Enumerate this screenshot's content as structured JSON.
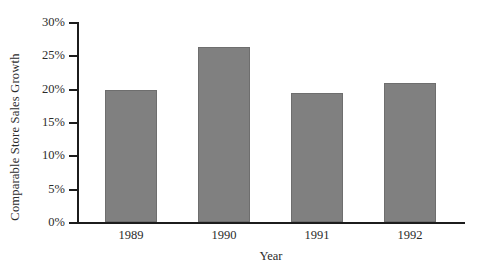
{
  "chart_data": {
    "type": "bar",
    "title": "",
    "xlabel": "Year",
    "ylabel": "Comparable Store Sales Growth",
    "categories": [
      "1989",
      "1990",
      "1991",
      "1992"
    ],
    "values": [
      19.8,
      26.3,
      19.4,
      20.9
    ],
    "value_labels": [
      "19.8%",
      "26.3%",
      "19.4%",
      "20.9%"
    ],
    "ylim": [
      0,
      30
    ],
    "y_ticks": [
      0,
      5,
      10,
      15,
      20,
      25,
      30
    ],
    "y_tick_labels": [
      "0%",
      "5%",
      "10%",
      "15%",
      "20%",
      "25%",
      "30%"
    ],
    "grid": false,
    "legend": false,
    "bar_color": "#808080",
    "axis_color": "#1c1c1c",
    "text_color": "#2b2b2b",
    "background_color": "#ffffff"
  }
}
